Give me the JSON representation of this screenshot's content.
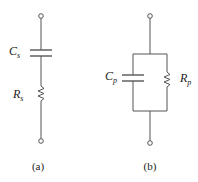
{
  "figure": {
    "circuit_a": {
      "label": "(a)",
      "description": "series RC",
      "capacitor": {
        "symbol": "C",
        "subscript": "s"
      },
      "resistor": {
        "symbol": "R",
        "subscript": "s"
      }
    },
    "circuit_b": {
      "label": "(b)",
      "description": "parallel RC",
      "capacitor": {
        "symbol": "C",
        "subscript": "p"
      },
      "resistor": {
        "symbol": "R",
        "subscript": "p"
      }
    },
    "colors": {
      "line": "#555555",
      "text": "#222222",
      "background": "#ffffff"
    }
  }
}
